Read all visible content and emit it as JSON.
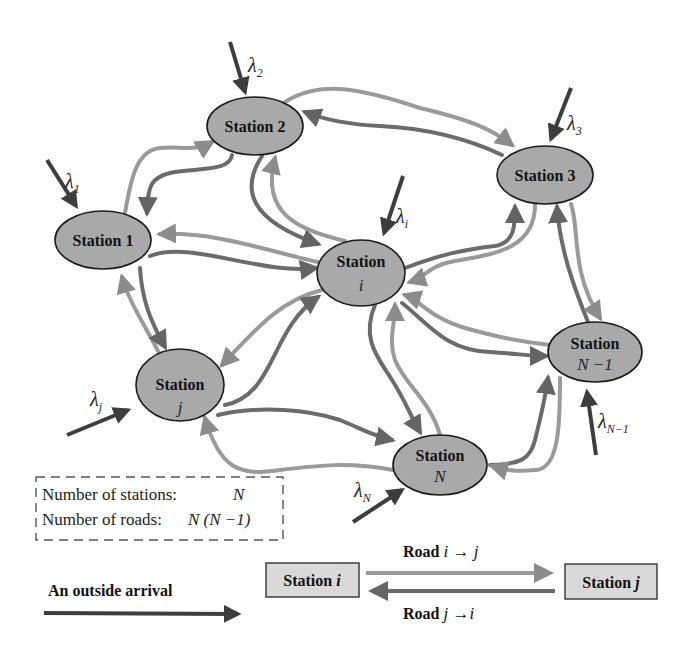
{
  "diagram": {
    "type": "network-of-stations",
    "colors": {
      "node_fill": "#a9a9a9",
      "node_stroke": "#1a1a1a",
      "road_light": "#9a9a9a",
      "road_dark": "#6b6b6b",
      "arrival_arrow": "#3d3d3d",
      "legend_box_fill": "#d9d9d9"
    },
    "stations": [
      {
        "id": "1",
        "label": "Station 1",
        "sub": "",
        "arrival": "λ",
        "arrival_sub": "1"
      },
      {
        "id": "2",
        "label": "Station 2",
        "sub": "",
        "arrival": "λ",
        "arrival_sub": "2"
      },
      {
        "id": "3",
        "label": "Station 3",
        "sub": "",
        "arrival": "λ",
        "arrival_sub": "3"
      },
      {
        "id": "i",
        "label": "Station",
        "sub": "i",
        "arrival": "λ",
        "arrival_sub": "i"
      },
      {
        "id": "j",
        "label": "Station",
        "sub": "j",
        "arrival": "λ",
        "arrival_sub": "j"
      },
      {
        "id": "N",
        "label": "Station",
        "sub": "N",
        "arrival": "λ",
        "arrival_sub": "N"
      },
      {
        "id": "N-1",
        "label": "Station",
        "sub": "N −1",
        "arrival": "λ",
        "arrival_sub": "N−1"
      }
    ],
    "roads": [
      [
        "1",
        "2"
      ],
      [
        "2",
        "1"
      ],
      [
        "1",
        "i"
      ],
      [
        "i",
        "1"
      ],
      [
        "1",
        "j"
      ],
      [
        "j",
        "1"
      ],
      [
        "2",
        "3"
      ],
      [
        "3",
        "2"
      ],
      [
        "2",
        "i"
      ],
      [
        "i",
        "2"
      ],
      [
        "3",
        "i"
      ],
      [
        "i",
        "3"
      ],
      [
        "3",
        "N-1"
      ],
      [
        "N-1",
        "3"
      ],
      [
        "i",
        "j"
      ],
      [
        "j",
        "i"
      ],
      [
        "i",
        "N"
      ],
      [
        "N",
        "i"
      ],
      [
        "i",
        "N-1"
      ],
      [
        "N-1",
        "i"
      ],
      [
        "j",
        "N"
      ],
      [
        "N",
        "j"
      ],
      [
        "N",
        "N-1"
      ],
      [
        "N-1",
        "N"
      ]
    ]
  },
  "info_box": {
    "stations_label": "Number of stations:",
    "stations_value": "N",
    "roads_label": "Number of roads:",
    "roads_value": "N (N −1)"
  },
  "legend": {
    "arrival_label": "An outside arrival",
    "station_i_label": "Station ",
    "station_i_var": "i",
    "station_j_label": "Station ",
    "station_j_var": "j",
    "road_ij_label": "Road ",
    "road_ij_expr": "i → j",
    "road_ji_label": "Road ",
    "road_ji_expr": "j →i"
  }
}
